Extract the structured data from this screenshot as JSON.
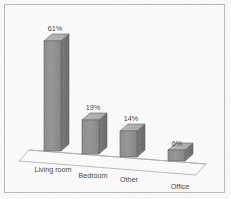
{
  "chart_data": {
    "type": "bar",
    "title": "",
    "subtitle": "",
    "xlabel": "",
    "ylabel": "",
    "categories": [
      "Living room",
      "Bedroom",
      "Other",
      "Office"
    ],
    "values": [
      61,
      19,
      14,
      6
    ],
    "value_labels": [
      "61%",
      "19%",
      "14%",
      "6%"
    ],
    "ylim": [
      0,
      70
    ],
    "grid": false,
    "legend": false,
    "legend_position": "none",
    "series": [
      {
        "name": "",
        "values": [
          61,
          19,
          14,
          6
        ]
      }
    ],
    "annotations": [],
    "style": {
      "three_d": true,
      "bar_front_color": "#8d8d8d",
      "bar_top_color": "#b5b5b5",
      "bar_side_color": "#6f6f6f",
      "bar_outline_color": "#5a5a5a",
      "floor_color": "#ffffff",
      "floor_outline_color": "#a8a8a8",
      "frame_color": "#b9b9b9",
      "background_color": "#ffffff",
      "label_color": "#3a3a3a"
    }
  },
  "bars": [
    {
      "category": "Living room",
      "value": 61,
      "value_label": "61%",
      "label_x": 55,
      "label_y": 31,
      "cat_label_x": 53,
      "cat_label_y": 172,
      "front_x": 44,
      "front_y": 41,
      "front_w": 17,
      "front_h": 110,
      "depth_x": 8,
      "depth_y": -7
    },
    {
      "category": "Bedroom",
      "value": 19,
      "value_label": "19%",
      "label_x": 93,
      "label_y": 110,
      "cat_label_x": 93,
      "cat_label_y": 178,
      "front_x": 82,
      "front_y": 120,
      "front_w": 17,
      "front_h": 34,
      "depth_x": 8,
      "depth_y": -7
    },
    {
      "category": "Other",
      "value": 14,
      "value_label": "14%",
      "label_x": 131,
      "label_y": 121,
      "cat_label_x": 129,
      "cat_label_y": 182,
      "front_x": 120,
      "front_y": 131,
      "front_w": 17,
      "front_h": 26,
      "depth_x": 8,
      "depth_y": -7
    },
    {
      "category": "Office",
      "value": 6,
      "value_label": "6%",
      "label_x": 177,
      "label_y": 146,
      "cat_label_x": 180,
      "cat_label_y": 189,
      "front_x": 168,
      "front_y": 150,
      "front_w": 17,
      "front_h": 11,
      "depth_x": 8,
      "depth_y": -7
    }
  ],
  "floor": {
    "front_left_x": 19,
    "front_left_y": 161,
    "front_right_x": 196,
    "front_right_y": 175,
    "back_right_x": 206,
    "back_right_y": 164,
    "back_left_x": 29,
    "back_left_y": 150
  },
  "baseline": {
    "left_x": 29,
    "left_y": 150,
    "right_x": 206,
    "right_y": 164
  }
}
